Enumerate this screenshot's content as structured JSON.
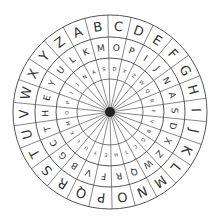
{
  "wheel": {
    "center": [
      110,
      112
    ],
    "segments": 26,
    "hub_radius": 5,
    "line_color": "#555555",
    "hub_color": "#222222",
    "rings": [
      {
        "name": "outer",
        "r_outer": 97,
        "r_inner": 75,
        "font_size": 13,
        "letters": [
          "A",
          "B",
          "C",
          "D",
          "E",
          "F",
          "G",
          "H",
          "I",
          "J",
          "K",
          "L",
          "M",
          "N",
          "O",
          "P",
          "Q",
          "R",
          "S",
          "T",
          "U",
          "V",
          "W",
          "X",
          "Y",
          "Z"
        ]
      },
      {
        "name": "middle",
        "r_outer": 75,
        "r_inner": 54,
        "font_size": 9,
        "letters": [
          "K",
          "M",
          "O",
          "P",
          "I",
          "J",
          "N",
          "A",
          "S",
          "D",
          "X",
          "Z",
          "W",
          "Q",
          "R",
          "F",
          "V",
          "B",
          "G",
          "C",
          "T",
          "H",
          "E",
          "Y",
          "U",
          "L"
        ]
      },
      {
        "name": "inner",
        "r_outer": 54,
        "r_inner": 33,
        "font_size": 5,
        "letters": [
          "A",
          "S",
          "D",
          "X",
          "Z",
          "W",
          "Q",
          "R",
          "F",
          "V",
          "B",
          "G",
          "C",
          "T",
          "H",
          "E",
          "Y",
          "U",
          "L",
          "K",
          "M",
          "O",
          "P",
          "I",
          "J",
          "N"
        ]
      }
    ],
    "start_angle_deg": -112
  }
}
